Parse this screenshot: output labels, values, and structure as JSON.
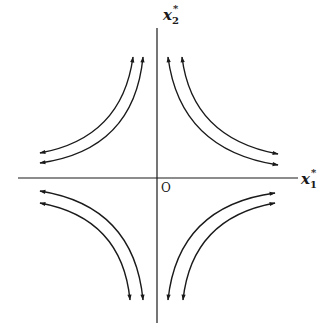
{
  "diagram": {
    "type": "phase-portrait",
    "axes": {
      "x": {
        "name": "x",
        "sub": "1",
        "sup": "*"
      },
      "y": {
        "name": "x",
        "sub": "2",
        "sup": "*"
      },
      "origin_label": "O"
    },
    "colors": {
      "line": "#1a1a1a",
      "background": "#ffffff"
    },
    "quadrants": [
      {
        "name": "upper-left",
        "curves": 2
      },
      {
        "name": "upper-right",
        "curves": 2
      },
      {
        "name": "lower-left",
        "curves": 2
      },
      {
        "name": "lower-right",
        "curves": 2
      }
    ]
  }
}
